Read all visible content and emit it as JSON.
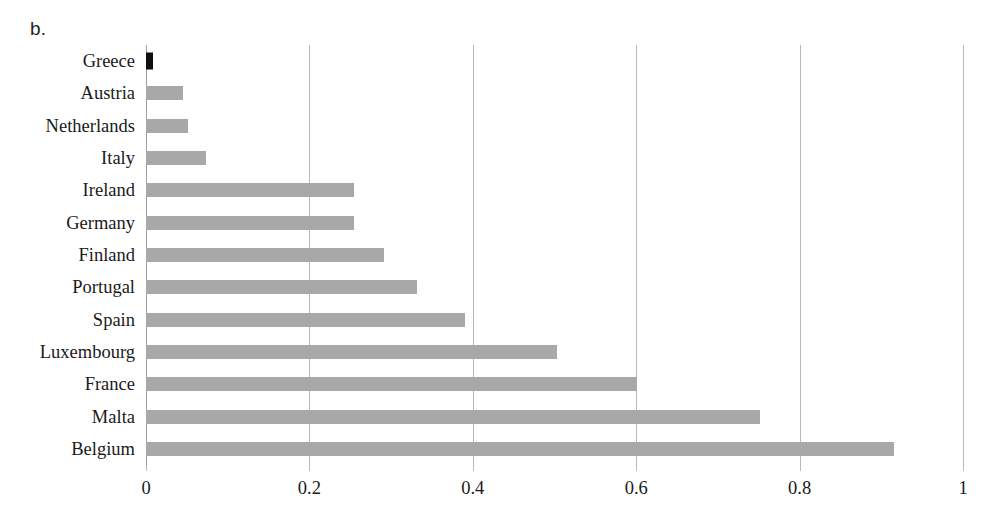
{
  "panel": {
    "letter": "b."
  },
  "chart_data": {
    "type": "bar",
    "orientation": "horizontal",
    "title": "",
    "subtitle": "",
    "xlabel": "",
    "ylabel": "",
    "xlim": [
      0,
      1
    ],
    "xticks": [
      0,
      0.2,
      0.4,
      0.6,
      0.8,
      1
    ],
    "xtick_labels": [
      "0",
      "0.2",
      "0.4",
      "0.6",
      "0.8",
      "1"
    ],
    "grid": "vertical",
    "legend": "none",
    "bar_color": "#a8a8a8",
    "highlight_color": "#101010",
    "categories": [
      "Greece",
      "Austria",
      "Netherlands",
      "Italy",
      "Ireland",
      "Germany",
      "Finland",
      "Portugal",
      "Spain",
      "Luxembourg",
      "France",
      "Malta",
      "Belgium"
    ],
    "values": [
      0.007,
      0.045,
      0.051,
      0.073,
      0.254,
      0.254,
      0.291,
      0.332,
      0.391,
      0.503,
      0.601,
      0.751,
      0.915
    ],
    "highlighted": [
      "Greece"
    ]
  }
}
